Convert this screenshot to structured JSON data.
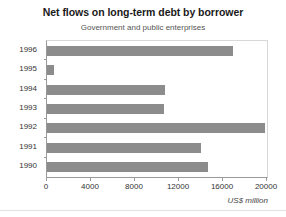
{
  "chart_data": {
    "type": "bar",
    "orientation": "horizontal",
    "title": "Net flows on long-term debt by borrower",
    "subtitle": "Government and public enterprises",
    "xlabel": "US$ million",
    "ylabel": "",
    "categories": [
      "1990",
      "1991",
      "1992",
      "1993",
      "1994",
      "1995",
      "1996"
    ],
    "values": [
      14600,
      14000,
      19800,
      10600,
      10700,
      600,
      16900
    ],
    "xlim": [
      0,
      20000
    ],
    "xticks": [
      0,
      4000,
      8000,
      12000,
      16000,
      20000
    ],
    "xtick_labels": [
      "0",
      "4000",
      "8000",
      "12000",
      "16000",
      "20000"
    ],
    "grid": false,
    "legend": false,
    "bar_color": "#8c8c8c",
    "background_color": "#ffffff",
    "axis_color": "#9a9a9a"
  }
}
